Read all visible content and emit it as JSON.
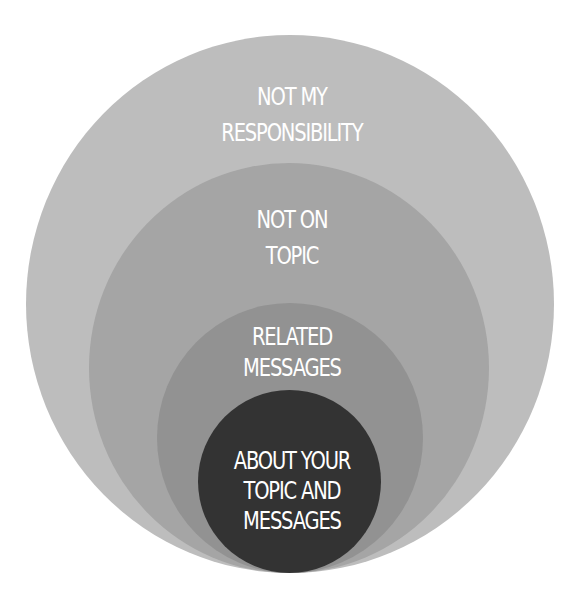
{
  "diagram": {
    "type": "nested-circles",
    "colors": {
      "background": "#ffffff",
      "text": "#ffffff",
      "ring_1": "#bdbdbd",
      "ring_2": "#a5a5a5",
      "ring_3": "#929292",
      "ring_4": "#333333"
    },
    "rings": [
      {
        "level": 1,
        "lines": [
          "NOT MY",
          "RESPONSIBILITY"
        ]
      },
      {
        "level": 2,
        "lines": [
          "NOT ON",
          "TOPIC"
        ]
      },
      {
        "level": 3,
        "lines": [
          "RELATED",
          "MESSAGES"
        ]
      },
      {
        "level": 4,
        "lines": [
          "ABOUT YOUR",
          "TOPIC AND",
          "MESSAGES"
        ]
      }
    ]
  }
}
